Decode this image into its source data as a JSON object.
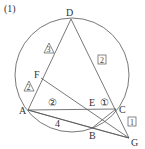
{
  "problem_number": "(1)",
  "points": {
    "A": {
      "label": "A",
      "x": 28,
      "y": 110
    },
    "B": {
      "label": "B",
      "x": 92,
      "y": 128
    },
    "C": {
      "label": "C",
      "x": 116,
      "y": 109
    },
    "D": {
      "label": "D",
      "x": 71,
      "y": 19
    },
    "E": {
      "label": "E",
      "x": 93,
      "y": 109
    },
    "F": {
      "label": "F",
      "x": 41,
      "y": 78
    },
    "G": {
      "label": "G",
      "x": 129,
      "y": 138
    }
  },
  "circle": {
    "cx": 72,
    "cy": 75,
    "r": 57
  },
  "annotations": {
    "triangle_3": "3",
    "triangle_2": "2",
    "circle_2": "②",
    "circle_1": "①",
    "box_2": "2",
    "box_1": "1",
    "length_AB": "4"
  }
}
